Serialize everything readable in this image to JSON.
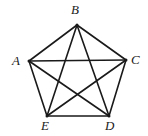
{
  "figure": {
    "type": "geometry-diagram",
    "name": "regular-pentagon-with-diagonals",
    "background_color": "#ffffff",
    "stroke_color": "#1a1a1a",
    "stroke_width": 1.6,
    "label_color": "#1a1a1a",
    "canvas": {
      "width": 148,
      "height": 136
    }
  },
  "vertices": [
    {
      "id": "A",
      "label": "A",
      "x": 29,
      "y": 61,
      "label_x": 12,
      "label_y": 54
    },
    {
      "id": "B",
      "label": "B",
      "x": 77,
      "y": 25,
      "label_x": 71,
      "label_y": 3
    },
    {
      "id": "C",
      "label": "C",
      "x": 126,
      "y": 60,
      "label_x": 131,
      "label_y": 53
    },
    {
      "id": "D",
      "label": "D",
      "x": 109,
      "y": 116,
      "label_x": 105,
      "label_y": 119
    },
    {
      "id": "E",
      "label": "E",
      "x": 47,
      "y": 116,
      "label_x": 41,
      "label_y": 119
    }
  ],
  "edges": [
    {
      "name": "side-AB",
      "from": "A",
      "to": "B",
      "kind": "side"
    },
    {
      "name": "side-BC",
      "from": "B",
      "to": "C",
      "kind": "side"
    },
    {
      "name": "side-CD",
      "from": "C",
      "to": "D",
      "kind": "side"
    },
    {
      "name": "side-DE",
      "from": "D",
      "to": "E",
      "kind": "side"
    },
    {
      "name": "side-EA",
      "from": "E",
      "to": "A",
      "kind": "side"
    },
    {
      "name": "diagonal-AC",
      "from": "A",
      "to": "C",
      "kind": "diagonal"
    },
    {
      "name": "diagonal-AD",
      "from": "A",
      "to": "D",
      "kind": "diagonal"
    },
    {
      "name": "diagonal-BD",
      "from": "B",
      "to": "D",
      "kind": "diagonal"
    },
    {
      "name": "diagonal-BE",
      "from": "B",
      "to": "E",
      "kind": "diagonal"
    },
    {
      "name": "diagonal-CE",
      "from": "C",
      "to": "E",
      "kind": "diagonal"
    }
  ]
}
